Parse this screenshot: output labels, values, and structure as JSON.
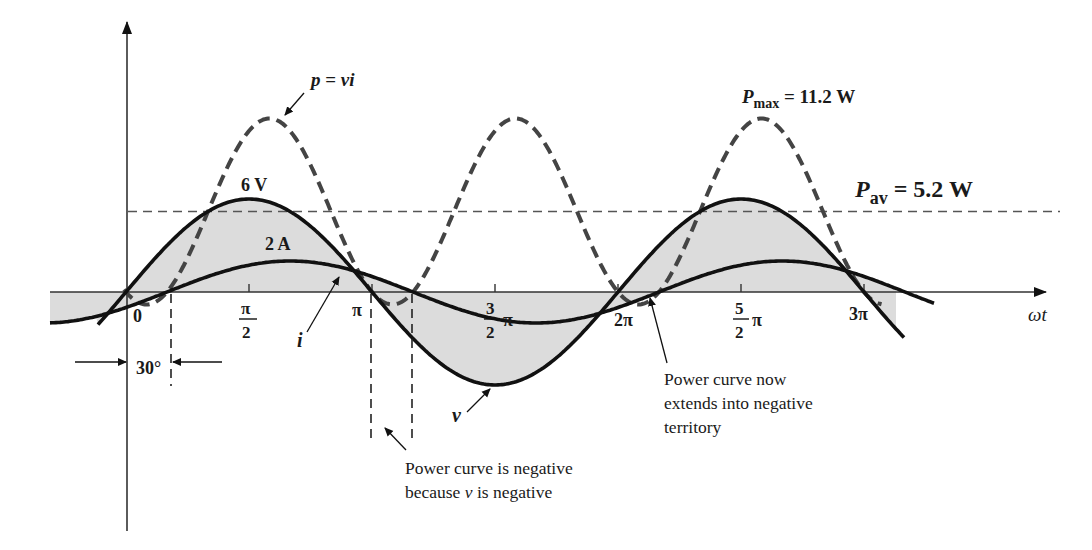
{
  "chart_data": {
    "type": "line",
    "title": "",
    "xlabel": "ωt",
    "ylabel": "",
    "x_ticks": [
      {
        "value": 0,
        "label": "0"
      },
      {
        "value": 0.5,
        "label": "π/2"
      },
      {
        "value": 1.0,
        "label": "π"
      },
      {
        "value": 1.5,
        "label": "3/2 π"
      },
      {
        "value": 2.0,
        "label": "2π"
      },
      {
        "value": 2.5,
        "label": "5/2 π"
      },
      {
        "value": 3.0,
        "label": "3π"
      }
    ],
    "x_units": "multiples of π (radians)",
    "series": [
      {
        "name": "v",
        "style": "solid",
        "formula": "6 sin(ωt)",
        "amplitude": 6,
        "unit": "V",
        "phase_deg": 0,
        "x": [
          0,
          0.5,
          1.0,
          1.5,
          2.0,
          2.5,
          3.0
        ],
        "values": [
          0,
          6,
          0,
          -6,
          0,
          6,
          0
        ]
      },
      {
        "name": "i",
        "style": "solid",
        "formula": "2 sin(ωt − 30°)",
        "amplitude": 2,
        "unit": "A",
        "phase_deg": -30,
        "x": [
          0,
          0.1667,
          0.6667,
          1.1667,
          1.6667,
          2.1667,
          2.6667,
          3.1667
        ],
        "values": [
          -1,
          0,
          2,
          0,
          -2,
          0,
          2,
          0
        ]
      },
      {
        "name": "p = vi",
        "style": "dashed",
        "formula": "5.2 − 6 cos(2ωt − 30°)",
        "unit": "W",
        "x": [
          0.0833,
          0.5833,
          1.0833,
          1.5833,
          2.0833,
          2.5833
        ],
        "values": [
          -0.8,
          11.2,
          -0.8,
          11.2,
          -0.8,
          11.2
        ]
      },
      {
        "name": "P_av",
        "style": "dashed-thin",
        "formula": "5.2",
        "unit": "W",
        "values": [
          5.2
        ]
      }
    ],
    "annotations": {
      "v_peak": "6 V",
      "i_peak": "2 A",
      "p_max": "11.2 W",
      "p_av": "5.2 W",
      "phase_shift": "30°"
    },
    "grid": false,
    "legend": "none"
  },
  "labels": {
    "p_eq": {
      "p": "p",
      "eq": " = ",
      "vi": "vi"
    },
    "pmax": {
      "sym": "P",
      "sub": "max",
      "val": " = 11.2 W"
    },
    "pav": {
      "sym": "P",
      "sub": "av",
      "val": " = 5.2 W"
    },
    "v_amp": "6 V",
    "i_amp": "2 A",
    "i_curve": "i",
    "v_curve": "v",
    "omega_t": "ωt",
    "phase": "30°",
    "tick_0": "0",
    "tick_half_pi_num": "π",
    "tick_half_pi_den": "2",
    "tick_pi": "π",
    "tick_3half_num": "3",
    "tick_3half_den": "2",
    "tick_3half_pi": "π",
    "tick_2pi": "2π",
    "tick_5half_num": "5",
    "tick_5half_den": "2",
    "tick_5half_pi": "π",
    "tick_3pi": "3π",
    "note_negative_line1": "Power curve is negative",
    "note_negative_line2a": "because ",
    "note_negative_line2v": "v",
    "note_negative_line2b": " is negative",
    "note_extends_line1": "Power curve now",
    "note_extends_line2": "extends into negative",
    "note_extends_line3": "territory"
  },
  "colors": {
    "curve": "#111111",
    "power_dash": "#444444",
    "shade": "#dcdcdc",
    "axis": "#333333",
    "pav_line": "#555555"
  }
}
